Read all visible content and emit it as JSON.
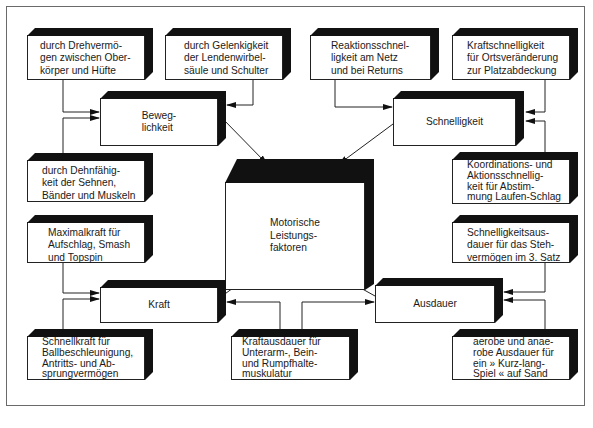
{
  "diagram": {
    "center": {
      "id": "center",
      "label": "Motorische\nLeistungs-\nfaktoren"
    },
    "factors": [
      {
        "id": "beweglichkeit",
        "label": "Beweg-\nlichkeit"
      },
      {
        "id": "schnelligkeit",
        "label": "Schnelligkeit"
      },
      {
        "id": "kraft",
        "label": "Kraft"
      },
      {
        "id": "ausdauer",
        "label": "Ausdauer"
      }
    ],
    "details": [
      {
        "id": "drehvermoegen",
        "parent": "beweglichkeit",
        "label": "durch Drehvermö-\ngen zwischen Ober-\nkörper und Hüfte"
      },
      {
        "id": "gelenkigkeit",
        "parent": "beweglichkeit",
        "label": "durch Gelenkigkeit\nder Lendenwirbel-\nsäule und Schulter"
      },
      {
        "id": "dehnfaehigkeit",
        "parent": "beweglichkeit",
        "label": "durch Dehnfähig-\nkeit der Sehnen,\nBänder und Muskeln"
      },
      {
        "id": "reaktion",
        "parent": "schnelligkeit",
        "label": "Reaktionsschnel-\nligkeit am Netz\nund bei Returns"
      },
      {
        "id": "kraftschnelligkeit",
        "parent": "schnelligkeit",
        "label": "Kraftschnelligkeit\nfür Ortsveränderung\nzur Platzabdeckung"
      },
      {
        "id": "koordination",
        "parent": "schnelligkeit",
        "label": "Koordinations- und\nAktionsschnellig-\nkeit für Abstim-\nmung Laufen-Schlag"
      },
      {
        "id": "maximalkraft",
        "parent": "kraft",
        "label": "Maximalkraft für\nAufschlag, Smash\nund Topspin"
      },
      {
        "id": "schnellkraft",
        "parent": "kraft",
        "label": "Schnellkraft für\nBallbeschleunigung,\nAntritts- und Ab-\nsprungvermögen"
      },
      {
        "id": "kraftausdauer",
        "parent": [
          "kraft",
          "ausdauer"
        ],
        "label": "Kraftausdauer für\nUnterarm-, Bein-\nund Rumpfhalte-\nmuskulatur"
      },
      {
        "id": "schnelligkeitsausdauer",
        "parent": "ausdauer",
        "label": "Schnelligkeitsaus-\ndauer für das Steh-\nvermögen im 3. Satz"
      },
      {
        "id": "aerobe",
        "parent": "ausdauer",
        "label": "aerobe und anae-\nrobe Ausdauer für\nein » Kurz-lang-\nSpiel « auf Sand"
      }
    ],
    "colors": {
      "line": "#222222",
      "bevel": "#111111",
      "frame": "#6a6a6a",
      "background": "#ffffff"
    }
  }
}
